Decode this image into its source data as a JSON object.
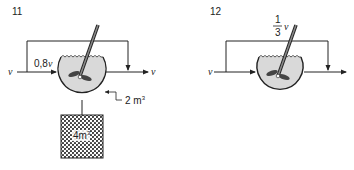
{
  "panels": [
    {
      "number": "11",
      "inlet_label": "v",
      "feed_label": "0,8v",
      "outlet_label": "v",
      "vessel_volume": "2 m³",
      "vessel_volume_base": "2 m",
      "vessel_volume_exp": "3",
      "tank_volume": "4m³",
      "tank_volume_base": "4m",
      "tank_volume_exp": "3"
    },
    {
      "number": "12",
      "inlet_label": "v",
      "bypass_num": "1",
      "bypass_den": "3",
      "bypass_var": "v"
    }
  ],
  "colors": {
    "line": "#222222",
    "liquid": "#d9d9d9",
    "hatch_dark": "#333333",
    "hatch_light": "#ffffff"
  }
}
